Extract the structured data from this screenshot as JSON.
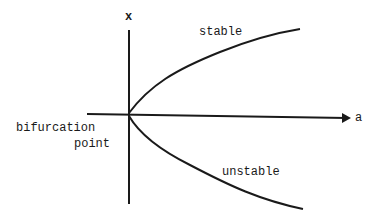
{
  "diagram": {
    "type": "pitchfork bifurcation diagram (half)",
    "axes": {
      "vertical_label": "x",
      "horizontal_label": "a"
    },
    "branches": {
      "upper": "stable",
      "lower": "unstable"
    },
    "origin_label_line1": "bifurcation",
    "origin_label_line2": "point",
    "colors": {
      "ink": "#1a1a1a",
      "background": "#ffffff"
    }
  }
}
